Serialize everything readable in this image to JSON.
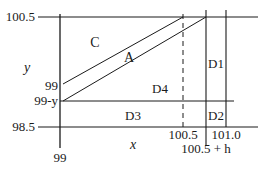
{
  "figure": {
    "axis_labels": {
      "x": "x",
      "y": "y"
    },
    "y_ticks": {
      "top": "100.5",
      "bottom": "98.5",
      "upper_mid": "99",
      "lower_mid": "99-y"
    },
    "x_ticks": {
      "left": "99",
      "mid": "100.5",
      "right": "101.0",
      "shifted": "100.5 + h"
    },
    "regions": {
      "C": "C",
      "A": "A",
      "D1": "D1",
      "D2": "D2",
      "D3": "D3",
      "D4": "D4"
    },
    "colors": {
      "stroke": "#1a1a1a",
      "background": "#ffffff"
    }
  }
}
